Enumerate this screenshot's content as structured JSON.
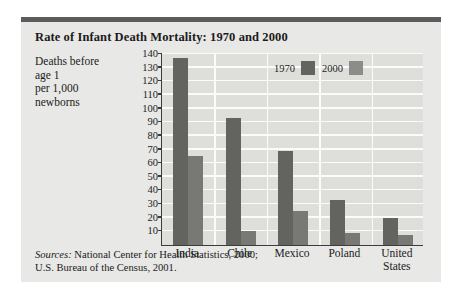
{
  "figure": {
    "title": "Rate of Infant Death Mortality: 1970 and 2000",
    "axis_caption_lines": [
      "Deaths before",
      "age 1",
      "per 1,000",
      "newborns"
    ],
    "sources_label": "Sources:",
    "sources_line1": " National Center for Health Statistics, 2000;",
    "sources_line2": "U.S. Bureau of the Census, 2001.",
    "colors": {
      "series_1970": "#63635f",
      "series_2000": "#787874",
      "panel_background": "#e8e8e6",
      "plot_background": "#dededa",
      "gridline": "#fbfbf9",
      "axis": "#3c3c3c",
      "top_rule": "#5c5c5c",
      "text": "#1b1b1b"
    }
  },
  "chart_data": {
    "type": "bar",
    "title": "Rate of Infant Death Mortality: 1970 and 2000",
    "xlabel": "",
    "ylabel": "Deaths before age 1 per 1,000 newborns",
    "categories": [
      "India",
      "Chile",
      "Mexico",
      "Poland",
      "United States"
    ],
    "series": [
      {
        "name": "1970",
        "values": [
          137,
          93,
          69,
          33,
          20
        ]
      },
      {
        "name": "2000",
        "values": [
          65,
          10,
          25,
          9,
          7
        ]
      }
    ],
    "ylim": [
      0,
      140
    ],
    "yticks": [
      10,
      20,
      30,
      40,
      50,
      60,
      70,
      80,
      90,
      100,
      110,
      120,
      130,
      140
    ],
    "ytick_labels": [
      "10",
      "20",
      "30",
      "40",
      "50",
      "60",
      "70",
      "80",
      "90",
      "100",
      "110",
      "120",
      "130",
      "140"
    ],
    "grid": true,
    "legend": [
      "1970",
      "2000"
    ],
    "legend_position": "top-center"
  }
}
